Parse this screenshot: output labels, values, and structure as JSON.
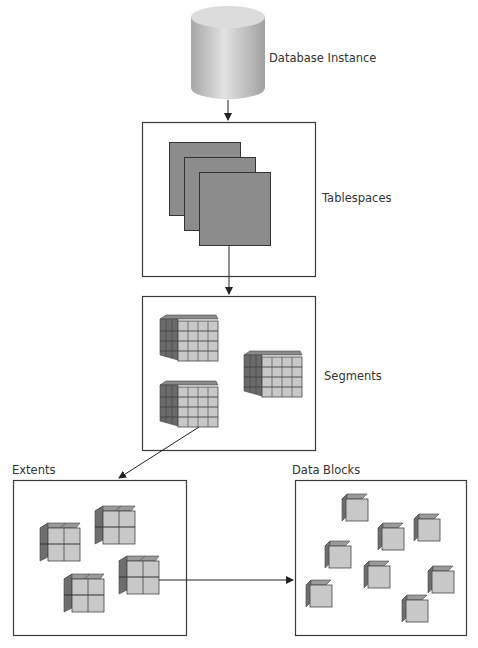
{
  "diagram": {
    "colors": {
      "stroke": "#3a3a3a",
      "tablespace_fill": "#8c8c8c",
      "cube_front": "#c8c8c8",
      "cube_side": "#6e6e6e",
      "cube_top": "#9a9a9a",
      "cylinder_light": "#d8d8d8",
      "cylinder_dark": "#9a9a9a"
    },
    "nodes": [
      {
        "id": "database-instance",
        "label": "Database Instance",
        "shape": "cylinder"
      },
      {
        "id": "tablespaces",
        "label": "Tablespaces",
        "shape": "box",
        "contents": "3 stacked sheets"
      },
      {
        "id": "segments",
        "label": "Segments",
        "shape": "box",
        "contents": "3 cubes (4x4x4 blocks)"
      },
      {
        "id": "extents",
        "label": "Extents",
        "shape": "box",
        "contents": "4 cubes (2x2x2 blocks)"
      },
      {
        "id": "data-blocks",
        "label": "Data Blocks",
        "shape": "box",
        "contents": "8 single cubes"
      }
    ],
    "edges": [
      {
        "from": "database-instance",
        "to": "tablespaces"
      },
      {
        "from": "tablespaces",
        "to": "segments"
      },
      {
        "from": "segments",
        "to": "extents"
      },
      {
        "from": "extents",
        "to": "data-blocks"
      }
    ]
  },
  "labels": {
    "database_instance": "Database Instance",
    "tablespaces": "Tablespaces",
    "segments": "Segments",
    "extents": "Extents",
    "data_blocks": "Data Blocks"
  }
}
